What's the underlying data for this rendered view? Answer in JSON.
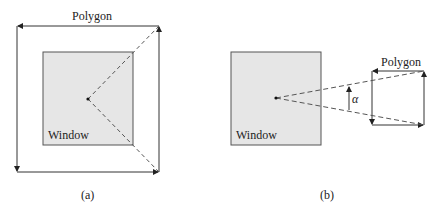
{
  "panels": [
    {
      "id": "a",
      "caption": "(a)",
      "window_label": "Window",
      "polygon_label": "Polygon",
      "window": {
        "x": 43,
        "y": 52,
        "w": 90,
        "h": 93,
        "fill": "#e6e6e6",
        "stroke": "#555555"
      },
      "polygon": {
        "left": 17,
        "top": 26,
        "right": 159,
        "bottom": 172
      },
      "point": {
        "x": 88,
        "y": 99
      }
    },
    {
      "id": "b",
      "caption": "(b)",
      "window_label": "Window",
      "polygon_label": "Polygon",
      "angle_label": "α",
      "window": {
        "x": 231,
        "y": 52,
        "w": 90,
        "h": 93,
        "fill": "#e6e6e6",
        "stroke": "#555555"
      },
      "polygon": {
        "left": 372,
        "top": 71,
        "right": 424,
        "bottom": 125
      },
      "point": {
        "x": 276,
        "y": 98
      }
    }
  ],
  "colors": {
    "line": "#333333",
    "dash": "#555555",
    "window_fill": "#e6e6e6"
  }
}
